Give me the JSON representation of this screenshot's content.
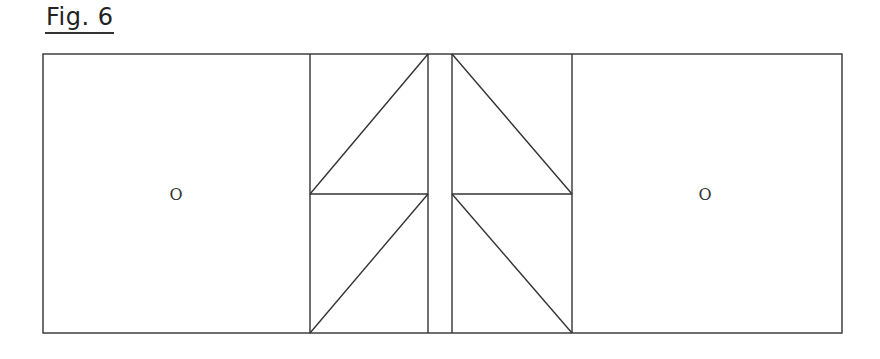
{
  "figure": {
    "title": "Fig. 6"
  },
  "diagram": {
    "left_panel_label": "O",
    "right_panel_label": "O",
    "line_color": "#333333",
    "background": "#ffffff"
  }
}
